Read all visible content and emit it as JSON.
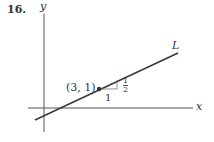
{
  "problem_number": "16.",
  "axes": {
    "y_label": "y",
    "x_label": "x"
  },
  "line_label": "L",
  "point_label": "(3, 1)",
  "slope_triangle": {
    "run": "1",
    "rise_num": "1",
    "rise_den": "2"
  },
  "colors": {
    "ink": "#333333",
    "line": "#3a3a3a",
    "axis": "#555555"
  }
}
